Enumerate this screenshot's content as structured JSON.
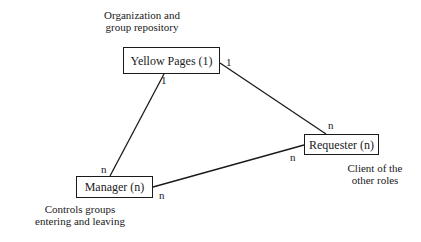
{
  "diagram": {
    "nodes": [
      {
        "id": "yellow-pages",
        "label": "Yellow Pages (1)",
        "x": 123,
        "y": 47,
        "w": 97,
        "h": 27
      },
      {
        "id": "requester",
        "label": "Requester (n)",
        "x": 304,
        "y": 134,
        "w": 75,
        "h": 21
      },
      {
        "id": "manager",
        "label": "Manager (n)",
        "x": 76,
        "y": 176,
        "w": 77,
        "h": 22
      }
    ],
    "notes": {
      "yellow_pages": [
        "Organization and",
        "group repository"
      ],
      "requester": [
        "Client of the",
        "other roles"
      ],
      "manager": [
        "Controls groups",
        "entering and leaving"
      ]
    },
    "edges": [
      {
        "from": "yellow-pages",
        "to": "requester",
        "from_mult": "1",
        "to_mult": "n"
      },
      {
        "from": "yellow-pages",
        "to": "manager",
        "from_mult": "1",
        "to_mult": "n"
      },
      {
        "from": "manager",
        "to": "requester",
        "from_mult": "n",
        "to_mult": "n"
      }
    ]
  }
}
